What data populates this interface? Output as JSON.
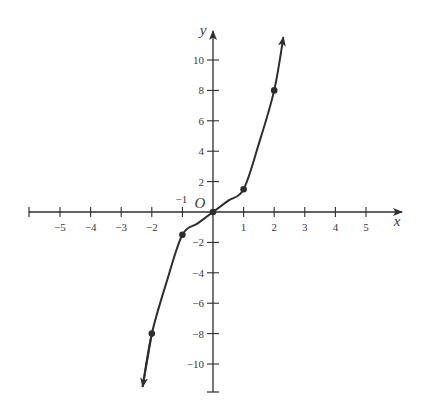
{
  "chart_data": {
    "type": "line",
    "title": "",
    "xlabel": "x",
    "ylabel": "y",
    "origin_label": "O",
    "xlim": [
      -6,
      6
    ],
    "ylim": [
      -12,
      12
    ],
    "grid": false,
    "x_ticks": [
      -5,
      -4,
      -3,
      -2,
      -1,
      1,
      2,
      3,
      4,
      5
    ],
    "x_tick_labels": [
      "−5",
      "−4",
      "−3",
      "−2",
      "−1",
      "1",
      "2",
      "3",
      "4",
      "5"
    ],
    "y_ticks": [
      -10,
      -8,
      -6,
      -4,
      -2,
      2,
      4,
      6,
      8,
      10
    ],
    "y_tick_labels": [
      "−10",
      "−8",
      "−6",
      "−4",
      "−2",
      "2",
      "4",
      "6",
      "8",
      "10"
    ],
    "series": [
      {
        "name": "curve",
        "x": [
          -2.3,
          -2,
          -1.5,
          -1,
          -0.5,
          0,
          0.5,
          1,
          1.5,
          2,
          2.3
        ],
        "y": [
          -11.5,
          -8,
          -4.5,
          -1.5,
          -0.75,
          0,
          0.75,
          1.5,
          4.5,
          8,
          11.5
        ],
        "arrows_at_ends": true
      }
    ],
    "marked_points": [
      {
        "x": -2,
        "y": -8
      },
      {
        "x": -1,
        "y": -1.5
      },
      {
        "x": 0,
        "y": 0
      },
      {
        "x": 1,
        "y": 1.5
      },
      {
        "x": 2,
        "y": 8
      }
    ],
    "colors": {
      "ink": "#2e2e2e",
      "background": "#ffffff"
    }
  }
}
